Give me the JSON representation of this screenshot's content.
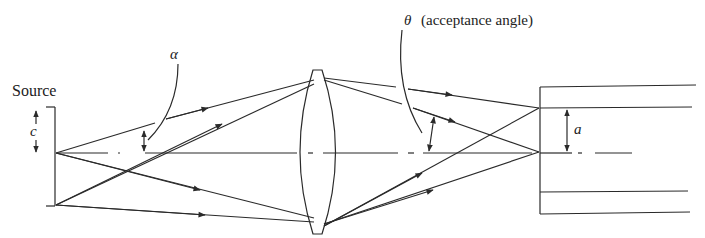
{
  "diagram": {
    "title": "",
    "labels": {
      "source": "Source",
      "c": "c",
      "alpha": "α",
      "theta": "θ",
      "acceptance": "(acceptance angle)",
      "a": "a"
    },
    "components": [
      "source",
      "converging-lens",
      "optical-fiber"
    ],
    "colors": {
      "line": "#2a2a2a",
      "text": "#222222",
      "background": "#ffffff"
    }
  }
}
